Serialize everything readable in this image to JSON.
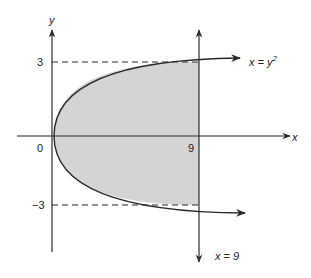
{
  "diagram": {
    "colors": {
      "line": "#2a2a2a",
      "shade": "#d4d4d4",
      "background": "#ffffff"
    },
    "axes": {
      "x_label": "x",
      "y_label": "y"
    },
    "ticks": {
      "origin": "0",
      "x_nine": "9",
      "y_three": "3",
      "y_neg_three": "−3"
    },
    "curves": {
      "parabola_label_lhs": "x = y",
      "parabola_label_exp": "2",
      "vertical_line_label": "x = 9"
    }
  }
}
